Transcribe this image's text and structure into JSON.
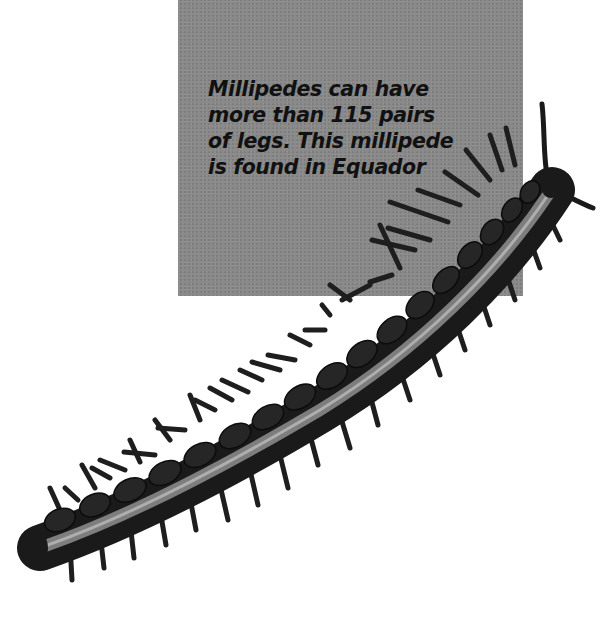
{
  "caption": {
    "lines": [
      "Millipedes can have",
      "more than 115 pairs",
      "of legs. This millipede",
      "is found in Equador"
    ]
  },
  "photo": {
    "subject": "millipede",
    "icon": "millipede-photo"
  },
  "colors": {
    "caption_box": "#8a8a8a",
    "caption_text": "#111111",
    "page_background": "#ffffff",
    "millipede_dark": "#1a1a1a",
    "millipede_band": "#9a9a9a"
  }
}
